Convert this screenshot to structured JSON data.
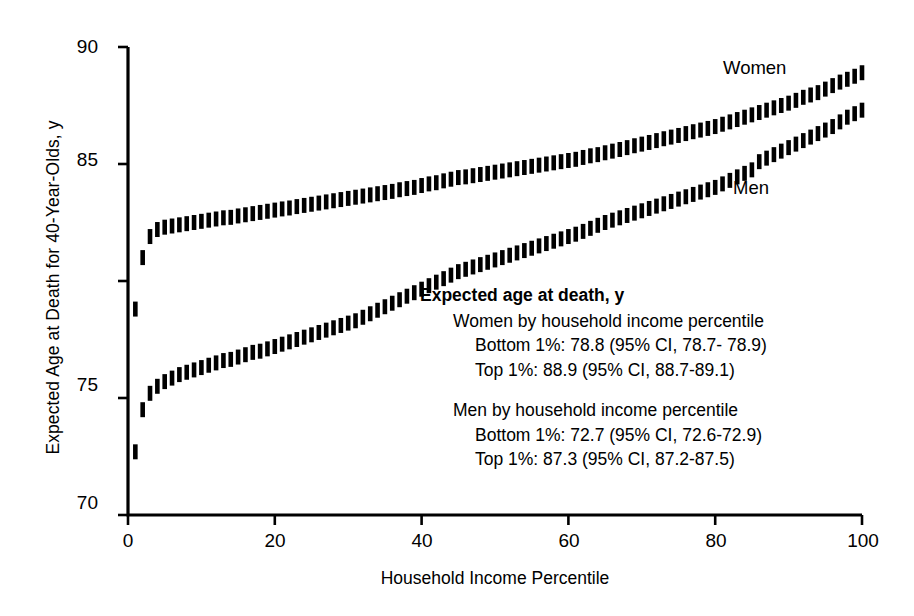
{
  "axes": {
    "ylabel": "Expected Age at Death for 40-Year-Olds, y",
    "xlabel": "Household Income Percentile",
    "yticks": [
      "90",
      "85",
      "",
      "75",
      "70"
    ],
    "xticks": [
      "0",
      "20",
      "40",
      "60",
      "80",
      "100"
    ]
  },
  "series_labels": {
    "women": "Women",
    "men": "Men"
  },
  "annotation": {
    "title": "Expected age at death, y",
    "women_head": "Women by household income percentile",
    "women_bottom": "Bottom 1%: 78.8 (95% CI, 78.7- 78.9)",
    "women_top": "Top 1%: 88.9 (95% CI, 88.7-89.1)",
    "men_head": "Men by household income percentile",
    "men_bottom": "Bottom 1%: 72.7 (95% CI, 72.6-72.9)",
    "men_top": "Top 1%: 87.3 (95% CI, 87.2-87.5)"
  },
  "colors": {
    "ink": "#000000",
    "background": "#ffffff"
  },
  "chart_data": {
    "type": "scatter",
    "title": "",
    "xlabel": "Household Income Percentile",
    "ylabel": "Expected Age at Death for 40-Year-Olds, y",
    "xlim": [
      0,
      100
    ],
    "ylim": [
      70,
      90
    ],
    "xticks": [
      0,
      20,
      40,
      60,
      80,
      100
    ],
    "yticks": [
      70,
      75,
      80,
      85,
      90
    ],
    "grid": false,
    "legend": "inline-labels",
    "marker": "vertical-ci-bar",
    "ci_halfheight_years": 0.16,
    "x": [
      1,
      2,
      3,
      4,
      5,
      6,
      7,
      8,
      9,
      10,
      11,
      12,
      13,
      14,
      15,
      16,
      17,
      18,
      19,
      20,
      21,
      22,
      23,
      24,
      25,
      26,
      27,
      28,
      29,
      30,
      31,
      32,
      33,
      34,
      35,
      36,
      37,
      38,
      39,
      40,
      41,
      42,
      43,
      44,
      45,
      46,
      47,
      48,
      49,
      50,
      51,
      52,
      53,
      54,
      55,
      56,
      57,
      58,
      59,
      60,
      61,
      62,
      63,
      64,
      65,
      66,
      67,
      68,
      69,
      70,
      71,
      72,
      73,
      74,
      75,
      76,
      77,
      78,
      79,
      80,
      81,
      82,
      83,
      84,
      85,
      86,
      87,
      88,
      89,
      90,
      91,
      92,
      93,
      94,
      95,
      96,
      97,
      98,
      99,
      100
    ],
    "series": [
      {
        "name": "Women",
        "values": [
          78.8,
          81.0,
          81.9,
          82.2,
          82.3,
          82.35,
          82.4,
          82.45,
          82.5,
          82.55,
          82.6,
          82.65,
          82.7,
          82.72,
          82.78,
          82.83,
          82.88,
          82.93,
          82.98,
          83.03,
          83.08,
          83.12,
          83.18,
          83.23,
          83.28,
          83.33,
          83.38,
          83.43,
          83.48,
          83.53,
          83.58,
          83.63,
          83.68,
          83.73,
          83.78,
          83.83,
          83.9,
          83.95,
          84.0,
          84.08,
          84.15,
          84.2,
          84.28,
          84.35,
          84.42,
          84.45,
          84.5,
          84.55,
          84.6,
          84.65,
          84.7,
          84.75,
          84.8,
          84.85,
          84.9,
          84.95,
          85.0,
          85.05,
          85.1,
          85.15,
          85.2,
          85.28,
          85.35,
          85.4,
          85.48,
          85.55,
          85.62,
          85.7,
          85.78,
          85.85,
          85.92,
          86.0,
          86.08,
          86.15,
          86.22,
          86.3,
          86.38,
          86.45,
          86.52,
          86.6,
          86.7,
          86.8,
          86.9,
          87.0,
          87.1,
          87.2,
          87.3,
          87.4,
          87.5,
          87.6,
          87.72,
          87.85,
          87.95,
          88.05,
          88.2,
          88.35,
          88.5,
          88.62,
          88.75,
          88.9
        ]
      },
      {
        "name": "Men",
        "values": [
          72.7,
          74.5,
          75.2,
          75.5,
          75.7,
          75.85,
          76.0,
          76.1,
          76.2,
          76.3,
          76.4,
          76.5,
          76.6,
          76.65,
          76.75,
          76.85,
          76.95,
          77.0,
          77.1,
          77.2,
          77.3,
          77.4,
          77.5,
          77.6,
          77.7,
          77.8,
          77.9,
          78.0,
          78.1,
          78.2,
          78.3,
          78.45,
          78.6,
          78.75,
          78.9,
          79.05,
          79.2,
          79.35,
          79.5,
          79.65,
          79.8,
          79.95,
          80.1,
          80.25,
          80.4,
          80.5,
          80.6,
          80.7,
          80.8,
          80.9,
          81.0,
          81.1,
          81.2,
          81.3,
          81.4,
          81.5,
          81.6,
          81.7,
          81.8,
          81.9,
          82.0,
          82.12,
          82.25,
          82.38,
          82.5,
          82.6,
          82.7,
          82.8,
          82.9,
          83.0,
          83.1,
          83.2,
          83.3,
          83.4,
          83.5,
          83.6,
          83.7,
          83.8,
          83.9,
          84.0,
          84.15,
          84.3,
          84.45,
          84.6,
          84.75,
          85.1,
          85.25,
          85.4,
          85.55,
          85.7,
          85.85,
          86.0,
          86.15,
          86.3,
          86.45,
          86.6,
          86.8,
          87.0,
          87.15,
          87.3
        ]
      }
    ]
  }
}
